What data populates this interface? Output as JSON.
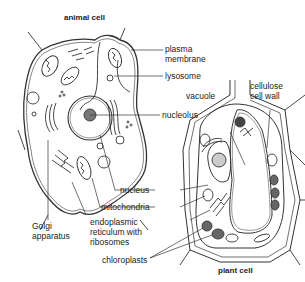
{
  "titles": {
    "animal": "animal cell",
    "plant": "plant cell"
  },
  "labels": {
    "plasma_membrane_1": "plasma",
    "plasma_membrane_2": "membrane",
    "lysosome": "lysosome",
    "nucleolus": "nucleolus",
    "vacuole": "vacuole",
    "cellulose_1": "cellulose",
    "cellulose_2": "cell wall",
    "nucleus": "nucleus",
    "mitochondria": "mitochondria",
    "golgi_1": "Golgi",
    "golgi_2": "apparatus",
    "er_1": "endoplasmic",
    "er_2": "reticulum with",
    "er_3": "ribosomes",
    "chloroplasts": "chloroplasts"
  }
}
